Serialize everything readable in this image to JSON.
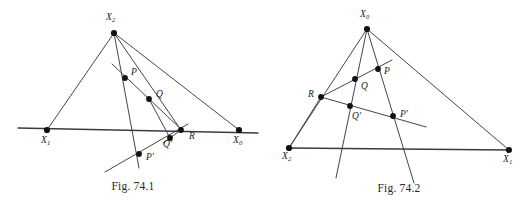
{
  "page": {
    "background": "#ffffff",
    "ink": "#3a3a42",
    "point_color": "#111111"
  },
  "figures": [
    {
      "id": "fig-74-1",
      "caption": "Fig. 74.1",
      "vertices": [
        {
          "name": "apex",
          "label": "X",
          "sub": "2",
          "x": 114,
          "y": 33,
          "lx": 106,
          "ly": 13
        },
        {
          "name": "left-base",
          "label": "X",
          "sub": "1",
          "x": 47,
          "y": 130,
          "lx": 41,
          "ly": 136
        },
        {
          "name": "right-base",
          "label": "X",
          "sub": "0",
          "x": 239,
          "y": 130,
          "lx": 233,
          "ly": 136
        }
      ],
      "points": [
        {
          "name": "P",
          "label": "P",
          "prime": "",
          "x": 125,
          "y": 78,
          "lx": 131,
          "ly": 68
        },
        {
          "name": "Q",
          "label": "Q",
          "prime": "",
          "x": 149,
          "y": 99,
          "lx": 156,
          "ly": 90
        },
        {
          "name": "R",
          "label": "R",
          "prime": "",
          "x": 181,
          "y": 130,
          "lx": 189,
          "ly": 132
        },
        {
          "name": "Q-prime",
          "label": "Q",
          "prime": "'",
          "x": 170,
          "y": 138,
          "lx": 163,
          "ly": 140
        },
        {
          "name": "P-prime",
          "label": "P",
          "prime": "'",
          "x": 139,
          "y": 154,
          "lx": 146,
          "ly": 153
        }
      ],
      "segments": [
        {
          "name": "side-apex-left",
          "x1": 114,
          "y1": 33,
          "x2": 47,
          "y2": 130
        },
        {
          "name": "side-apex-right",
          "x1": 114,
          "y1": 33,
          "x2": 239,
          "y2": 130
        },
        {
          "name": "cevian-apex-R",
          "x1": 114,
          "y1": 33,
          "x2": 181,
          "y2": 130
        },
        {
          "name": "cevian-apex-Pprime",
          "x1": 114,
          "y1": 33,
          "x2": 139,
          "y2": 168
        },
        {
          "name": "baseline",
          "x1": 18,
          "y1": 128,
          "x2": 258,
          "y2": 133
        },
        {
          "name": "line-P-R",
          "x1": 112,
          "y1": 64,
          "x2": 183,
          "y2": 131
        },
        {
          "name": "line-Q-Qprime",
          "x1": 149,
          "y1": 99,
          "x2": 170,
          "y2": 138
        },
        {
          "name": "line-R-Qprime",
          "x1": 181,
          "y1": 130,
          "x2": 163,
          "y2": 143
        },
        {
          "name": "transversal-lower",
          "x1": 105,
          "y1": 172,
          "x2": 188,
          "y2": 124
        }
      ]
    },
    {
      "id": "fig-74-2",
      "caption": "Fig. 74.2",
      "vertices": [
        {
          "name": "apex",
          "label": "X",
          "sub": "0",
          "x": 101,
          "y": 29,
          "lx": 94,
          "ly": 10
        },
        {
          "name": "left-base",
          "label": "X",
          "sub": "2",
          "x": 23,
          "y": 148,
          "lx": 16,
          "ly": 152
        },
        {
          "name": "right-base",
          "label": "X",
          "sub": "1",
          "x": 243,
          "y": 150,
          "lx": 237,
          "ly": 155
        }
      ],
      "points": [
        {
          "name": "R",
          "label": "R",
          "prime": "",
          "x": 55,
          "y": 97,
          "lx": 42,
          "ly": 90
        },
        {
          "name": "Q",
          "label": "Q",
          "prime": "",
          "x": 89,
          "y": 79,
          "lx": 95,
          "ly": 82
        },
        {
          "name": "P",
          "label": "P",
          "prime": "",
          "x": 112,
          "y": 69,
          "lx": 118,
          "ly": 67
        },
        {
          "name": "Q-prime",
          "label": "Q",
          "prime": "'",
          "x": 84,
          "y": 106,
          "lx": 86,
          "ly": 112
        },
        {
          "name": "P-prime",
          "label": "P",
          "prime": "'",
          "x": 127,
          "y": 116,
          "lx": 134,
          "ly": 110
        }
      ],
      "segments": [
        {
          "name": "side-apex-left",
          "x1": 101,
          "y1": 29,
          "x2": 23,
          "y2": 148
        },
        {
          "name": "side-apex-right",
          "x1": 101,
          "y1": 29,
          "x2": 243,
          "y2": 150
        },
        {
          "name": "baseline",
          "x1": 23,
          "y1": 148,
          "x2": 243,
          "y2": 150
        },
        {
          "name": "cevian-apex-down-1",
          "x1": 101,
          "y1": 29,
          "x2": 70,
          "y2": 178
        },
        {
          "name": "cevian-apex-down-2",
          "x1": 101,
          "y1": 29,
          "x2": 148,
          "y2": 183
        },
        {
          "name": "line-R-P",
          "x1": 55,
          "y1": 97,
          "x2": 126,
          "y2": 60
        },
        {
          "name": "line-R-Pprime",
          "x1": 55,
          "y1": 97,
          "x2": 160,
          "y2": 127
        },
        {
          "name": "line-R-baseline",
          "x1": 55,
          "y1": 97,
          "x2": 23,
          "y2": 148
        }
      ]
    }
  ]
}
